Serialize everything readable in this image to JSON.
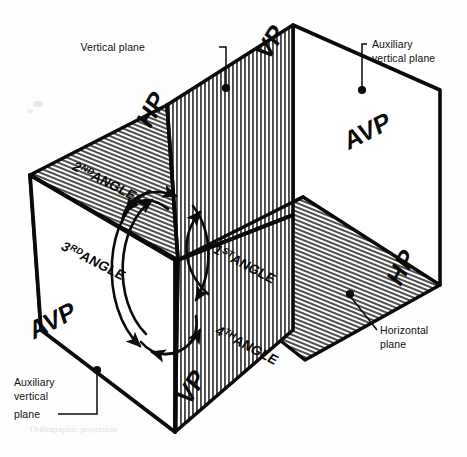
{
  "figure": {
    "background_color": "#ffffff",
    "ink_color": "#0a0a0a"
  },
  "planes": [
    {
      "id": "vertical-plane-upper",
      "tag": "VP",
      "name": "Vertical plane",
      "fill": "vertical-hatch",
      "tag_position": {
        "x": 268,
        "y": 62
      },
      "tag_rotation": -58
    },
    {
      "id": "vertical-plane-lower",
      "tag": "VP",
      "name": "Vertical plane",
      "fill": "vertical-hatch",
      "tag_position": {
        "x": 189,
        "y": 407
      },
      "tag_rotation": -58
    },
    {
      "id": "horizontal-plane-left",
      "tag": "HP",
      "name": "Horizontal plane",
      "fill": "diagonal-hatch",
      "tag_position": {
        "x": 150,
        "y": 130
      },
      "tag_rotation": -62
    },
    {
      "id": "horizontal-plane-right",
      "tag": "HP",
      "name": "Horizontal plane",
      "fill": "diagonal-hatch",
      "tag_position": {
        "x": 400,
        "y": 288
      },
      "tag_rotation": -62
    },
    {
      "id": "auxiliary-vertical-plane-right",
      "tag": "AVP",
      "name": "Auxiliary vertical plane",
      "fill": "plain-white",
      "tag_position": {
        "x": 392,
        "y": 128
      },
      "tag_rotation": -27
    },
    {
      "id": "auxiliary-vertical-plane-left",
      "tag": "AVP",
      "name": "Auxiliary vertical plane",
      "fill": "plain-white",
      "tag_position": {
        "x": 33,
        "y": 340
      },
      "tag_rotation": -27
    }
  ],
  "callouts": [
    {
      "id": "vertical-plane-callout",
      "lines": [
        "Vertical plane"
      ],
      "text_anchor": {
        "x": 145,
        "y": 51
      },
      "dot": {
        "x": 226,
        "y": 88
      }
    },
    {
      "id": "auxiliary-vertical-plane-callout-top",
      "lines": [
        "Auxiliary",
        "vertical plane"
      ],
      "text_anchor": {
        "x": 370,
        "y": 48
      },
      "dot": {
        "x": 362,
        "y": 90
      }
    },
    {
      "id": "horizontal-plane-callout",
      "lines": [
        "Horizontal",
        "plane"
      ],
      "text_anchor": {
        "x": 380,
        "y": 333
      },
      "dot": {
        "x": 350,
        "y": 294
      }
    },
    {
      "id": "auxiliary-vertical-plane-callout-bottom",
      "lines": [
        "Auxiliary",
        "vertical",
        "plane"
      ],
      "text_anchor": {
        "x": 14,
        "y": 396
      },
      "dot": {
        "x": 97,
        "y": 370
      }
    }
  ],
  "angles": [
    {
      "id": "first-angle",
      "ordinal": "1",
      "ordinal_suffix": "ST",
      "word": "ANGLE",
      "label_position": {
        "x": 212,
        "y": 252
      },
      "label_rotation": 28
    },
    {
      "id": "second-angle",
      "ordinal": "2",
      "ordinal_suffix": "ND",
      "word": "ANGLE",
      "label_position": {
        "x": 71,
        "y": 169
      },
      "label_rotation": 27
    },
    {
      "id": "third-angle",
      "ordinal": "3",
      "ordinal_suffix": "RD",
      "word": "ANGLE",
      "label_position": {
        "x": 60,
        "y": 249
      },
      "label_rotation": 27
    },
    {
      "id": "fourth-angle",
      "ordinal": "4",
      "ordinal_suffix": "TH",
      "word": "ANGLE",
      "label_position": {
        "x": 214,
        "y": 333
      },
      "label_rotation": 28
    }
  ],
  "caption": {
    "text": "Orthographic projection",
    "visible": "faint"
  },
  "colors": {
    "ink": "#0a0a0a",
    "hatch": "#3b3b3b",
    "paper": "#ffffff",
    "smudge": "#c4c4c4"
  }
}
